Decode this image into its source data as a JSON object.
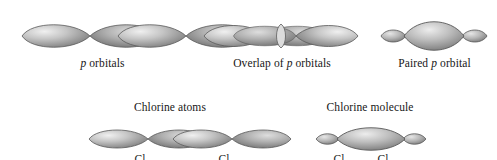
{
  "figure": {
    "background_color": "#ffffff",
    "orbital_fill_light": "#e8e8e8",
    "orbital_fill_mid": "#a9a9a9",
    "orbital_fill_dark": "#6f6f6f",
    "orbital_stroke": "#5a5a5a",
    "text_color": "#171717"
  },
  "top_row": {
    "panels": [
      {
        "id": "p-orbitals",
        "caption_prefix": "",
        "caption_italic": "p",
        "caption_suffix": " orbitals",
        "caption_full": "p orbitals",
        "shape": "two-separate-dumbbells",
        "orbital_count": 2
      },
      {
        "id": "overlap-of-p-orbitals",
        "caption_prefix": "Overlap of ",
        "caption_italic": "p",
        "caption_suffix": " orbitals",
        "caption_full": "Overlap of p orbitals",
        "shape": "two-dumbbells-overlapping",
        "orbital_count": 2
      },
      {
        "id": "paired-p-orbital",
        "caption_prefix": "Paired ",
        "caption_italic": "p",
        "caption_suffix": " orbital",
        "caption_full": "Paired p orbital",
        "shape": "merged-lens-with-small-outer-lobes",
        "orbital_count": 1
      }
    ]
  },
  "bottom_row": {
    "panels": [
      {
        "id": "chlorine-atoms",
        "heading": "Chlorine atoms",
        "shape": "two-separate-dumbbells",
        "orbital_count": 2,
        "atom_labels": [
          "Cl",
          "Cl"
        ]
      },
      {
        "id": "chlorine-molecule",
        "heading": "Chlorine molecule",
        "shape": "merged-lens-with-small-outer-lobes",
        "orbital_count": 1,
        "atom_labels": [
          "Cl",
          "Cl"
        ],
        "bond_symbol": "—"
      }
    ]
  }
}
